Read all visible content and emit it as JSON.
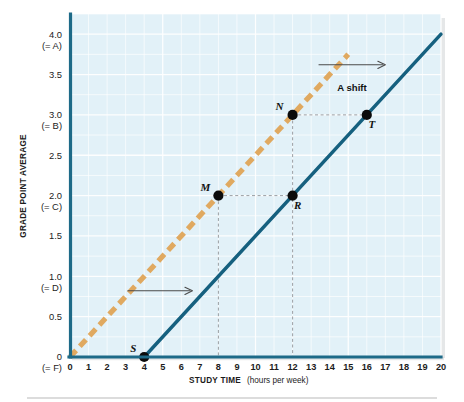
{
  "chart_data": {
    "type": "line",
    "title": "",
    "xlabel": "STUDY TIME",
    "xlabel_sub": "(hours per week)",
    "ylabel": "GRADE POINT AVERAGE",
    "xlim": [
      0,
      20
    ],
    "ylim": [
      0,
      4.25
    ],
    "grid": true,
    "legend_position": "none",
    "x_ticks": [
      {
        "value": 0,
        "label": "0"
      },
      {
        "value": 1,
        "label": "1"
      },
      {
        "value": 2,
        "label": "2"
      },
      {
        "value": 3,
        "label": "3"
      },
      {
        "value": 4,
        "label": "4"
      },
      {
        "value": 5,
        "label": "5"
      },
      {
        "value": 6,
        "label": "6"
      },
      {
        "value": 7,
        "label": "7"
      },
      {
        "value": 8,
        "label": "8"
      },
      {
        "value": 9,
        "label": "9"
      },
      {
        "value": 10,
        "label": "10"
      },
      {
        "value": 11,
        "label": "11"
      },
      {
        "value": 12,
        "label": "12"
      },
      {
        "value": 13,
        "label": "13"
      },
      {
        "value": 14,
        "label": "14"
      },
      {
        "value": 15,
        "label": "15"
      },
      {
        "value": 16,
        "label": "16"
      },
      {
        "value": 17,
        "label": "17"
      },
      {
        "value": 18,
        "label": "18"
      },
      {
        "value": 19,
        "label": "19"
      },
      {
        "value": 20,
        "label": "20"
      }
    ],
    "y_ticks": [
      {
        "value": 0.0,
        "label": "0",
        "sublabel": "(= F)"
      },
      {
        "value": 0.5,
        "label": "0.5",
        "sublabel": ""
      },
      {
        "value": 1.0,
        "label": "1.0",
        "sublabel": "(= D)"
      },
      {
        "value": 1.5,
        "label": "1.5",
        "sublabel": ""
      },
      {
        "value": 2.0,
        "label": "2.0",
        "sublabel": "(= C)"
      },
      {
        "value": 2.5,
        "label": "2.5",
        "sublabel": ""
      },
      {
        "value": 3.0,
        "label": "3.0",
        "sublabel": "(= B)"
      },
      {
        "value": 3.5,
        "label": "3.5",
        "sublabel": ""
      },
      {
        "value": 4.0,
        "label": "4.0",
        "sublabel": "(= A)"
      }
    ],
    "series": [
      {
        "name": "original-curve",
        "style": "dashed",
        "color": "#e0a960",
        "points": [
          [
            0,
            0
          ],
          [
            15,
            3.75
          ]
        ]
      },
      {
        "name": "shifted-curve",
        "style": "solid",
        "color": "#15607f",
        "points": [
          [
            4,
            0
          ],
          [
            20,
            4.0
          ]
        ]
      }
    ],
    "data_points": [
      {
        "label": "S",
        "x": 4,
        "y": 0.0,
        "label_dx": -11,
        "label_dy": -5
      },
      {
        "label": "M",
        "x": 8,
        "y": 2.0,
        "label_dx": -13,
        "label_dy": -5
      },
      {
        "label": "R",
        "x": 12,
        "y": 2.0,
        "label_dx": 5,
        "label_dy": 13
      },
      {
        "label": "N",
        "x": 12,
        "y": 3.0,
        "label_dx": -13,
        "label_dy": -5
      },
      {
        "label": "T",
        "x": 16,
        "y": 3.0,
        "label_dx": 5,
        "label_dy": 13
      }
    ],
    "guides": [
      {
        "name": "guide-m-to-r",
        "from": [
          8,
          2.0
        ],
        "to": [
          12,
          2.0
        ]
      },
      {
        "name": "guide-n-to-t",
        "from": [
          12,
          3.0
        ],
        "to": [
          16,
          3.0
        ]
      },
      {
        "name": "guide-m-drop",
        "from": [
          8,
          2.0
        ],
        "to": [
          8,
          0.0
        ]
      },
      {
        "name": "guide-n-drop",
        "from": [
          12,
          3.0
        ],
        "to": [
          12,
          0.0
        ]
      }
    ],
    "annotations": [
      {
        "name": "a-shift-arrow",
        "text": "A shift",
        "arrow_from": [
          13.4,
          3.62
        ],
        "arrow_to": [
          17.0,
          3.62
        ],
        "text_x": 15.2,
        "text_y": 3.3
      },
      {
        "name": "lower-shift-arrow",
        "text": "",
        "arrow_from": [
          3.1,
          0.82
        ],
        "arrow_to": [
          6.6,
          0.82
        ],
        "text_x": 0,
        "text_y": 0
      }
    ],
    "colors": {
      "plot_background": "#e2f1f8",
      "gridline": "#ffffff",
      "axis": "#1d6a88",
      "solid_curve": "#15607f",
      "dashed_curve": "#e0a960",
      "point": "#0b0b0b",
      "guide": "#8a8f94",
      "annotation": "#4a4a4a",
      "page_background": "#ffffff"
    }
  }
}
